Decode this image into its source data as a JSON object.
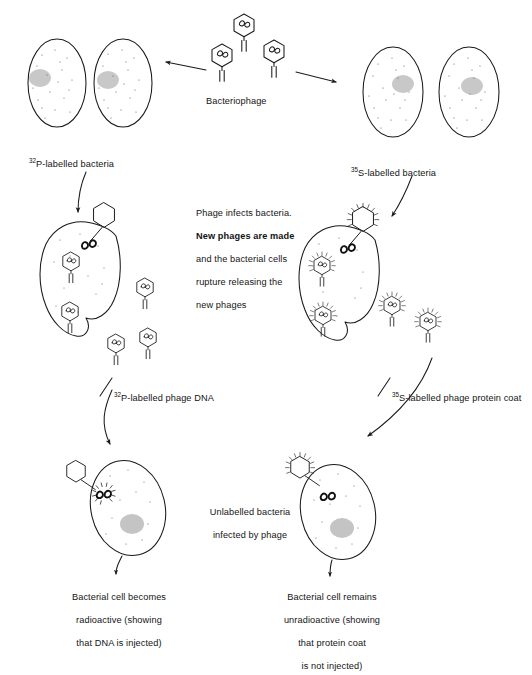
{
  "figure": {
    "background_color": "#ffffff",
    "ink_color": "#1a1a1a"
  },
  "labels": {
    "bacteriophage": "Bacteriophage",
    "p32_bacteria_sup": "32",
    "p32_bacteria_text": "P-labelled bacteria",
    "s35_bacteria_sup": "35",
    "s35_bacteria_text": "S-labelled bacteria",
    "process_line1": "Phage infects bacteria.",
    "process_line2": "New phages are made",
    "process_line3": "and the bacterial cells",
    "process_line4": "rupture releasing the",
    "process_line5": "new phages",
    "p32_dna_sup": "32",
    "p32_dna_text": "P-labelled phage DNA",
    "s35_coat_sup": "35",
    "s35_coat_text": "S-labelled phage protein coat",
    "unlabelled_line1": "Unlabelled bacteria",
    "unlabelled_line2": "infected by phage",
    "conclusion_left_line1": "Bacterial cell becomes",
    "conclusion_left_line2": "radioactive (showing",
    "conclusion_left_line3": "that DNA is injected)",
    "conclusion_right_line1": "Bacterial cell remains",
    "conclusion_right_line2": "unradioactive (showing",
    "conclusion_right_line3": "that protein coat",
    "conclusion_right_line4": "is not injected)"
  },
  "diagram_elements": {
    "free_phages_top": 3,
    "bacteria_left_top": 2,
    "bacteria_right_top": 2,
    "phages_inside_left_cell": 2,
    "phages_released_left": 3,
    "phages_inside_right_cell": 2,
    "phages_released_right": 2,
    "bottom_cells": 2,
    "arrow_count": 8
  }
}
